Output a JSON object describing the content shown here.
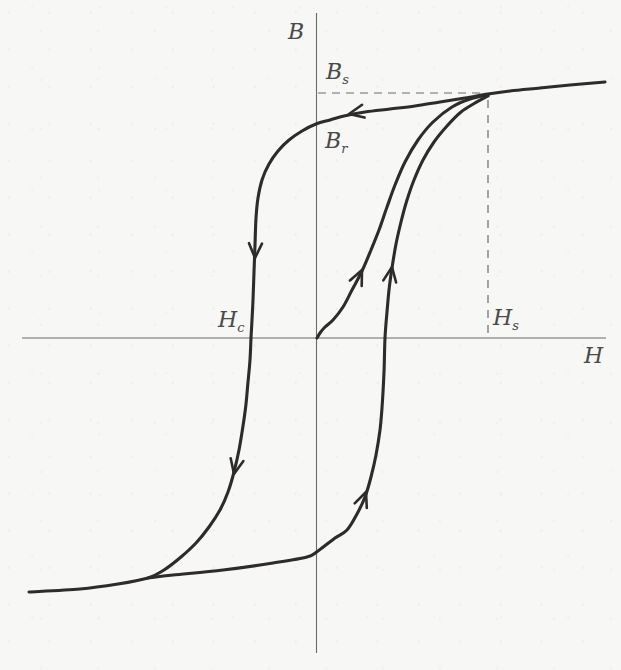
{
  "figure": {
    "kind": "scanned-textbook-figure",
    "paper_color": "#f7f7f5",
    "curve_color": "#2e2c2a",
    "axis_color": "#6b6b68",
    "dash_color": "#6b6b68",
    "label_color": "#4a4a48"
  },
  "labels": {
    "b_axis": "B",
    "h_axis": "H",
    "b_s": {
      "main": "B",
      "sub": "s"
    },
    "b_r": {
      "main": "B",
      "sub": "r"
    },
    "h_c": {
      "main": "H",
      "sub": "c"
    },
    "h_s": {
      "main": "H",
      "sub": "s"
    }
  },
  "chart_data": {
    "type": "line",
    "xlabel": "H",
    "ylabel": "B",
    "axis_numbers_shown": false,
    "grid": false,
    "legend": false,
    "coordinate_space": "figure pixels; axes cross at (316.5, 338); +x right, +y down",
    "axes": {
      "b_axis": {
        "x": 316.5,
        "y1": 13,
        "y2": 653
      },
      "h_axis": {
        "y": 338,
        "x1": 22,
        "x2": 606
      }
    },
    "guides": {
      "bs_level_dash": {
        "x1": 318,
        "y1": 93,
        "x2": 486,
        "y2": 93
      },
      "hs_vertical_dash": {
        "x1": 488,
        "y1": 100,
        "x2": 488,
        "y2": 337
      },
      "saturation_point": [
        488,
        95
      ]
    },
    "key_points": {
      "Bs": [
        316.5,
        93
      ],
      "Br": [
        316.5,
        124
      ],
      "Hc": [
        252,
        338
      ],
      "Hs": [
        488,
        338
      ],
      "origin": [
        316.5,
        338
      ]
    },
    "series": [
      {
        "name": "descending-branch-with-saturation-tails",
        "width": 3.1,
        "points": [
          [
            605,
            82
          ],
          [
            570,
            85
          ],
          [
            540,
            88
          ],
          [
            510,
            91
          ],
          [
            488,
            94
          ],
          [
            465,
            98
          ],
          [
            440,
            102
          ],
          [
            415,
            106
          ],
          [
            390,
            109
          ],
          [
            365,
            112
          ],
          [
            344,
            116
          ],
          [
            330,
            120
          ],
          [
            316,
            124
          ],
          [
            302,
            131
          ],
          [
            289,
            140
          ],
          [
            278,
            151
          ],
          [
            269,
            164
          ],
          [
            262,
            180
          ],
          [
            258,
            198
          ],
          [
            256,
            218
          ],
          [
            255,
            245
          ],
          [
            254,
            272
          ],
          [
            253,
            300
          ],
          [
            252,
            320
          ],
          [
            251,
            338
          ],
          [
            250,
            360
          ],
          [
            248,
            382
          ],
          [
            246,
            404
          ],
          [
            243,
            426
          ],
          [
            239,
            450
          ],
          [
            234,
            472
          ],
          [
            228,
            492
          ],
          [
            220,
            510
          ],
          [
            209,
            527
          ],
          [
            196,
            543
          ],
          [
            181,
            557
          ],
          [
            164,
            570
          ],
          [
            148,
            578
          ],
          [
            118,
            584
          ],
          [
            80,
            589
          ],
          [
            29,
            592
          ]
        ]
      },
      {
        "name": "ascending-branch",
        "width": 3.1,
        "points": [
          [
            148,
            578
          ],
          [
            173,
            575
          ],
          [
            223,
            570
          ],
          [
            273,
            563
          ],
          [
            307,
            557
          ],
          [
            318,
            551
          ],
          [
            335,
            538
          ],
          [
            347,
            530
          ],
          [
            357,
            514
          ],
          [
            365,
            497
          ],
          [
            371,
            477
          ],
          [
            376,
            455
          ],
          [
            380,
            430
          ],
          [
            382,
            408
          ],
          [
            384,
            372
          ],
          [
            385,
            338
          ],
          [
            387,
            312
          ],
          [
            389,
            290
          ],
          [
            392,
            268
          ],
          [
            396,
            244
          ],
          [
            401,
            222
          ],
          [
            407,
            200
          ],
          [
            414,
            180
          ],
          [
            423,
            160
          ],
          [
            434,
            142
          ],
          [
            447,
            126
          ],
          [
            461,
            112
          ],
          [
            475,
            103
          ],
          [
            488,
            96
          ]
        ]
      },
      {
        "name": "initial-magnetization-curve",
        "width": 3.1,
        "points": [
          [
            317,
            338
          ],
          [
            320,
            333
          ],
          [
            325,
            327
          ],
          [
            333,
            320
          ],
          [
            343,
            307
          ],
          [
            352,
            290
          ],
          [
            362,
            271
          ],
          [
            371,
            250
          ],
          [
            379,
            230
          ],
          [
            387,
            207
          ],
          [
            395,
            185
          ],
          [
            405,
            162
          ],
          [
            418,
            140
          ],
          [
            433,
            122
          ],
          [
            452,
            107
          ],
          [
            470,
            99
          ],
          [
            488,
            95
          ]
        ]
      }
    ],
    "arrows": [
      {
        "name": "upper-branch-left-arrow",
        "x": 349,
        "y": 114,
        "angle": 169,
        "len": 16,
        "spread": 24
      },
      {
        "name": "descending-upper-down-arrow",
        "x": 255,
        "y": 258,
        "angle": 92,
        "len": 16,
        "spread": 24
      },
      {
        "name": "descending-lower-down-arrow",
        "x": 234,
        "y": 474,
        "angle": 102,
        "len": 16,
        "spread": 24
      },
      {
        "name": "initial-curve-up-arrow",
        "x": 362,
        "y": 270,
        "angle": 295,
        "len": 16,
        "spread": 24
      },
      {
        "name": "ascending-upper-up-arrow",
        "x": 392,
        "y": 267,
        "angle": 279,
        "len": 16,
        "spread": 24
      },
      {
        "name": "ascending-lower-up-arrow",
        "x": 366,
        "y": 492,
        "angle": 291,
        "len": 16,
        "spread": 24
      }
    ]
  }
}
